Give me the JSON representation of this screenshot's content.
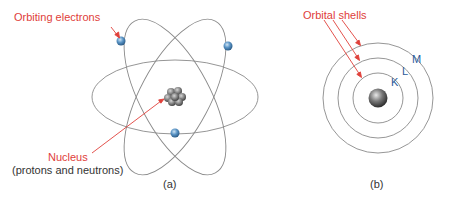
{
  "panel_a": {
    "caption": "(a)",
    "electrons_label": "Orbiting electrons",
    "nucleus_label": "Nucleus",
    "nucleus_sublabel": "(protons and neutrons)"
  },
  "panel_b": {
    "caption": "(b)",
    "shells_label": "Orbital shells",
    "shell_names": [
      "K",
      "L",
      "M"
    ],
    "shell_k": "K",
    "shell_l": "L",
    "shell_m": "M"
  },
  "colors": {
    "label_red": "#e0403a",
    "shell_blue": "#2a5a9a",
    "orbit_gray": "#8a8a8a",
    "electron_blue": "#4a86b8"
  }
}
